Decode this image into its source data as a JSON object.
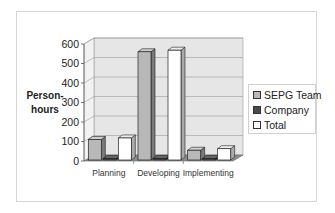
{
  "chart_data": {
    "type": "bar",
    "style": "3d-clustered-column",
    "title": "",
    "xlabel": "",
    "ylabel": "Person-hours",
    "ylim": [
      0,
      600
    ],
    "yticks": [
      0,
      100,
      200,
      300,
      400,
      500,
      600
    ],
    "grid": true,
    "legend_position": "right",
    "categories": [
      "Planning",
      "Developing",
      "Implementing"
    ],
    "series": [
      {
        "name": "SEPG Team",
        "color": "#b8b8b8",
        "values": [
          105,
          555,
          50
        ]
      },
      {
        "name": "Company",
        "color": "#4a4a4a",
        "values": [
          8,
          8,
          8
        ]
      },
      {
        "name": "Total",
        "color": "#ffffff",
        "values": [
          113,
          563,
          58
        ]
      }
    ]
  },
  "ylabel_lines": [
    "Person-",
    "hours"
  ],
  "legend": {
    "items": [
      "SEPG Team",
      "Company",
      "Total"
    ]
  }
}
